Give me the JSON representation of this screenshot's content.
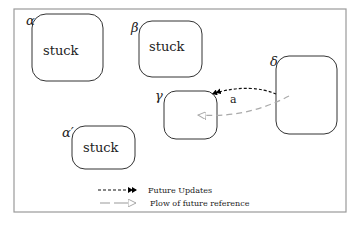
{
  "diagram": {
    "nodes": [
      {
        "id": "alpha",
        "label": "α",
        "text": "stuck"
      },
      {
        "id": "beta",
        "label": "β",
        "text": "stuck"
      },
      {
        "id": "gamma",
        "label": "γ",
        "text": ""
      },
      {
        "id": "delta",
        "label": "δ",
        "text": ""
      },
      {
        "id": "alpha_prime",
        "label": "α′",
        "text": "stuck"
      }
    ],
    "edges": [
      {
        "from": "delta",
        "to": "gamma",
        "label": "a",
        "style": "dashed-black",
        "meaning": "Future Updates"
      },
      {
        "from": "delta",
        "to": "gamma",
        "label": "",
        "style": "dashed-gray",
        "meaning": "Flow of future reference"
      }
    ],
    "legend": [
      {
        "label": "Future Updates",
        "style": "dashed-black-double-arrow",
        "color": "#000000"
      },
      {
        "label": "Flow of future reference",
        "style": "dashed-gray-open-arrow",
        "color": "#aaaaaa"
      }
    ]
  }
}
